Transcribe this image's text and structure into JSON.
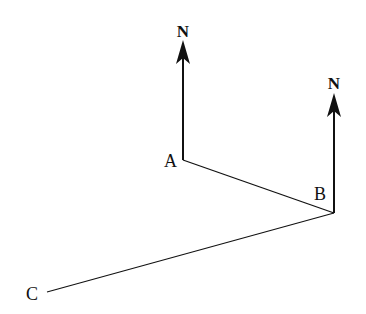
{
  "diagram": {
    "points": [
      {
        "id": "A",
        "label": "A",
        "x": 183,
        "y": 160,
        "lx": 164,
        "ly": 167
      },
      {
        "id": "B",
        "label": "B",
        "x": 334,
        "y": 213,
        "lx": 314,
        "ly": 200
      },
      {
        "id": "C",
        "label": "C",
        "x": 47,
        "y": 292,
        "lx": 26,
        "ly": 300
      }
    ],
    "north_arrows": [
      {
        "at": "A",
        "label": "N",
        "x": 183,
        "y_top": 40,
        "y_bottom": 160,
        "label_x": 183,
        "label_y": 37
      },
      {
        "at": "B",
        "label": "N",
        "x": 334,
        "y_top": 93,
        "y_bottom": 213,
        "label_x": 334,
        "label_y": 89
      }
    ],
    "segments": [
      {
        "from": "A",
        "to": "B"
      },
      {
        "from": "B",
        "to": "C"
      }
    ],
    "colors": {
      "line": "#111111",
      "background": "#ffffff"
    }
  }
}
